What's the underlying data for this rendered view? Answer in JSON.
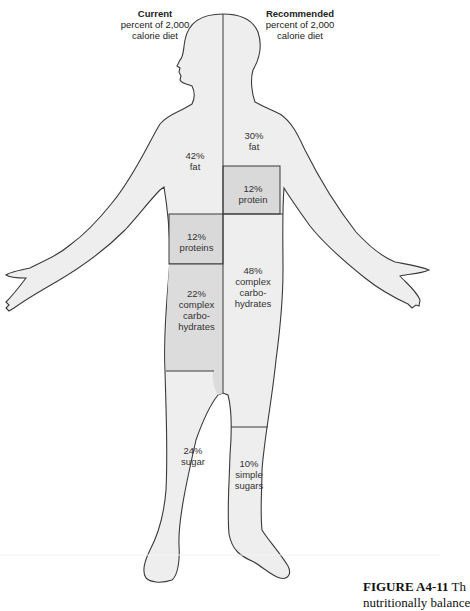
{
  "headers": {
    "current": {
      "title": "Current",
      "line1": "percent of 2,000",
      "line2": "calorie diet"
    },
    "recommended": {
      "title": "Recommended",
      "line1": "percent of 2,000",
      "line2": "calorie diet"
    }
  },
  "current": {
    "fat": {
      "pct": "42%",
      "l1": "fat"
    },
    "proteins": {
      "pct": "12%",
      "l1": "proteins"
    },
    "complex": {
      "pct": "22%",
      "l1": "complex",
      "l2": "carbo-",
      "l3": "hydrates"
    },
    "sugar": {
      "pct": "24%",
      "l1": "sugar"
    }
  },
  "recommended": {
    "fat": {
      "pct": "30%",
      "l1": "fat"
    },
    "protein": {
      "pct": "12%",
      "l1": "protein"
    },
    "complex": {
      "pct": "48%",
      "l1": "complex",
      "l2": "carbo-",
      "l3": "hydrates"
    },
    "simple": {
      "pct": "10%",
      "l1": "simple",
      "l2": "sugars"
    }
  },
  "caption": {
    "label": "FIGURE A4-11",
    "text1": " Th",
    "text2": "nutritionally balance"
  },
  "colors": {
    "body_fill": "#eeeeee",
    "shade_fill": "#d9d9d9",
    "outline": "#3a3a3a"
  }
}
